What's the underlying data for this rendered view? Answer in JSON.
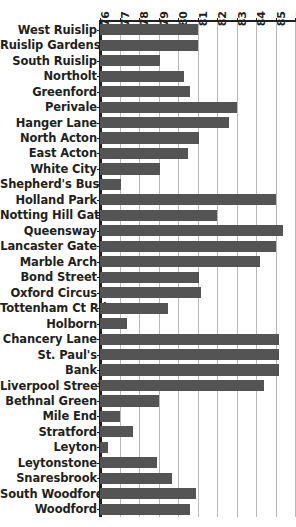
{
  "chart_data": {
    "type": "bar",
    "orientation": "horizontal",
    "title": "",
    "subtitle": "",
    "xlabel": "",
    "ylabel": "",
    "xlim": [
      76,
      86
    ],
    "ylim": null,
    "grid": true,
    "grid_axis": "x",
    "legend": null,
    "legend_position": "none",
    "bar_color": "#545454",
    "axis_color": "#231f20",
    "gridline_color": "#b9b9b9",
    "background_color": "#ffffff",
    "xticks": [
      76,
      77,
      78,
      79,
      80,
      81,
      82,
      83,
      84,
      85,
      86
    ],
    "xtick_labels": [
      "76",
      "77",
      "78",
      "79",
      "80",
      "81",
      "82",
      "83",
      "84",
      "85",
      "86"
    ],
    "xtick_rotation": 90,
    "categories": [
      "West Ruislip",
      "Ruislip Gardens",
      "South Ruislip",
      "Northolt",
      "Greenford",
      "Perivale",
      "Hanger Lane",
      "North Acton",
      "East Acton",
      "White City",
      "Shepherd's Bush",
      "Holland Park",
      "Notting Hill Gate",
      "Queensway",
      "Lancaster Gate",
      "Marble Arch",
      "Bond Street",
      "Oxford Circus",
      "Tottenham Ct Rd",
      "Holborn",
      "Chancery Lane",
      "St. Paul's",
      "Bank",
      "Liverpool Street",
      "Bethnal Green",
      "Mile End",
      "Stratford",
      "Leyton",
      "Leytonstone",
      "Snaresbrook",
      "South Woodford",
      "Woodford"
    ],
    "values": [
      81.0,
      81.0,
      79.1,
      80.3,
      80.6,
      83.0,
      82.6,
      81.1,
      80.5,
      79.1,
      77.1,
      85.0,
      82.0,
      85.4,
      85.0,
      84.2,
      81.1,
      81.2,
      79.5,
      77.4,
      85.2,
      85.2,
      85.2,
      84.4,
      79.0,
      77.0,
      77.7,
      76.4,
      78.9,
      79.7,
      80.9,
      80.6
    ]
  }
}
